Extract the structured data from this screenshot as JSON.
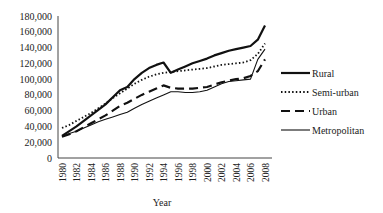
{
  "chart_data": {
    "type": "line",
    "title": "",
    "xlabel": "Year",
    "ylabel": "",
    "ylim": [
      0,
      180000
    ],
    "grid": false,
    "legend_position": "right",
    "y_ticks": [
      "0",
      "20,000",
      "40,000",
      "60,000",
      "80,000",
      "100,000",
      "120,000",
      "140,000",
      "160,000",
      "180,000"
    ],
    "x_ticks": [
      "1980",
      "1982",
      "1984",
      "1986",
      "1988",
      "1990",
      "1992",
      "1994",
      "1996",
      "1998",
      "2000",
      "2002",
      "2004",
      "2006",
      "2008"
    ],
    "x": [
      1980,
      1981,
      1982,
      1983,
      1984,
      1985,
      1986,
      1987,
      1988,
      1989,
      1990,
      1991,
      1992,
      1993,
      1994,
      1995,
      1996,
      1997,
      1998,
      1999,
      2000,
      2001,
      2002,
      2003,
      2004,
      2005,
      2006,
      2007,
      2008
    ],
    "series": [
      {
        "name": "Rural",
        "style": "solid-thick",
        "values": [
          28000,
          34000,
          40000,
          47000,
          54000,
          61000,
          68000,
          77000,
          86000,
          90000,
          100000,
          108000,
          114000,
          118000,
          121000,
          108000,
          112000,
          116000,
          120000,
          123000,
          126000,
          130000,
          133000,
          136000,
          138000,
          140000,
          142000,
          150000,
          168000
        ]
      },
      {
        "name": "Semi-urban",
        "style": "dotted",
        "values": [
          38000,
          42000,
          47000,
          52000,
          57000,
          63000,
          69000,
          76000,
          82000,
          88000,
          94000,
          99000,
          103000,
          106000,
          108000,
          109000,
          110000,
          111000,
          112000,
          113000,
          114000,
          116000,
          118000,
          119000,
          120000,
          121000,
          124000,
          132000,
          145000
        ]
      },
      {
        "name": "Urban",
        "style": "dashed",
        "values": [
          27000,
          30000,
          34000,
          39000,
          44000,
          49000,
          54000,
          60000,
          66000,
          70000,
          75000,
          80000,
          84000,
          88000,
          92000,
          89000,
          88000,
          88000,
          88000,
          89000,
          90000,
          93000,
          96000,
          98000,
          100000,
          101000,
          104000,
          110000,
          125000
        ]
      },
      {
        "name": "Metropolitan",
        "style": "solid-thin",
        "values": [
          27000,
          31000,
          34000,
          38000,
          42000,
          46000,
          49000,
          52000,
          55000,
          58000,
          63000,
          68000,
          72000,
          76000,
          80000,
          84000,
          84000,
          83000,
          83000,
          84000,
          86000,
          90000,
          94000,
          97000,
          98000,
          99000,
          100000,
          125000,
          138000
        ]
      }
    ]
  },
  "legend": {
    "items": [
      {
        "label": "Rural"
      },
      {
        "label": "Semi-urban"
      },
      {
        "label": "Urban"
      },
      {
        "label": "Metropolitan"
      }
    ]
  }
}
